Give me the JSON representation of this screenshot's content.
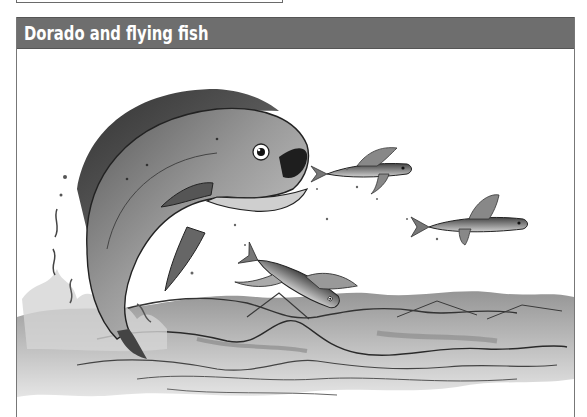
{
  "figure": {
    "title": "Dorado and flying fish",
    "header_color": "#6e6e6e",
    "title_color": "#ffffff",
    "illustration": {
      "subject": "dorado-leaping-after-flying-fish",
      "elements": [
        "dorado",
        "flying-fish-1",
        "flying-fish-2",
        "flying-fish-3",
        "water-splash",
        "ocean-waves"
      ]
    }
  }
}
